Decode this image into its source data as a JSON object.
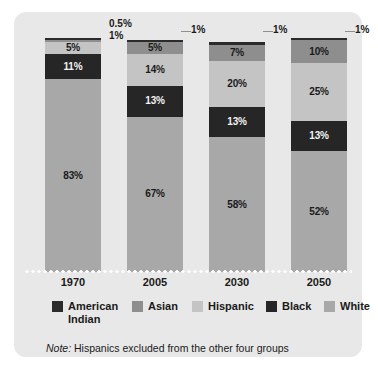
{
  "chart_data": {
    "type": "bar",
    "subtype": "stacked-100-percent",
    "title": "",
    "xlabel": "",
    "ylabel": "",
    "ylim": [
      0,
      100
    ],
    "grid": false,
    "legend_position": "bottom",
    "categories": [
      "1970",
      "2005",
      "2030",
      "2050"
    ],
    "series": [
      {
        "name": "American Indian",
        "color": "#2b2b2b",
        "values": [
          0.5,
          1,
          1,
          1
        ]
      },
      {
        "name": "Asian",
        "color": "#8e8e8e",
        "values": [
          1,
          5,
          7,
          10
        ]
      },
      {
        "name": "Hispanic",
        "color": "#c4c4c4",
        "values": [
          5,
          14,
          20,
          25
        ]
      },
      {
        "name": "Black",
        "color": "#262626",
        "values": [
          11,
          13,
          13,
          13
        ]
      },
      {
        "name": "White",
        "color": "#a8a8a8",
        "values": [
          83,
          67,
          58,
          52
        ]
      }
    ],
    "note": "Hispanics excluded from the other four groups",
    "note_prefix": "Note:"
  },
  "colors": {
    "card": "#e8e8e8",
    "page": "#ffffff",
    "american_indian": "#2b2b2b",
    "asian": "#8e8e8e",
    "hispanic": "#c4c4c4",
    "black": "#262626",
    "white_group": "#a8a8a8",
    "text": "#1a1a1a",
    "baseline_dots": "#ffffff"
  },
  "bars": [
    {
      "year": "1970",
      "segments": [
        {
          "group": "American Indian",
          "value": 0.5,
          "label": "0.5%",
          "label_inside": false,
          "color_key": "american_indian"
        },
        {
          "group": "Asian",
          "value": 1,
          "label": "1%",
          "label_inside": false,
          "color_key": "asian"
        },
        {
          "group": "Hispanic",
          "value": 5,
          "label": "5%",
          "label_inside": true,
          "color_key": "hispanic",
          "label_tone": "dark-text"
        },
        {
          "group": "Black",
          "value": 11,
          "label": "11%",
          "label_inside": true,
          "color_key": "black",
          "label_tone": "light-text"
        },
        {
          "group": "White",
          "value": 83,
          "label": "83%",
          "label_inside": true,
          "color_key": "white_group",
          "label_tone": "dark-text"
        }
      ],
      "callout": "0.5%\n1%"
    },
    {
      "year": "2005",
      "segments": [
        {
          "group": "American Indian",
          "value": 1,
          "label": "1%",
          "label_inside": false,
          "color_key": "american_indian"
        },
        {
          "group": "Asian",
          "value": 5,
          "label": "5%",
          "label_inside": true,
          "color_key": "asian",
          "label_tone": "dark-text"
        },
        {
          "group": "Hispanic",
          "value": 14,
          "label": "14%",
          "label_inside": true,
          "color_key": "hispanic",
          "label_tone": "dark-text"
        },
        {
          "group": "Black",
          "value": 13,
          "label": "13%",
          "label_inside": true,
          "color_key": "black",
          "label_tone": "light-text"
        },
        {
          "group": "White",
          "value": 67,
          "label": "67%",
          "label_inside": true,
          "color_key": "white_group",
          "label_tone": "dark-text"
        }
      ],
      "callout": "1%"
    },
    {
      "year": "2030",
      "segments": [
        {
          "group": "American Indian",
          "value": 1,
          "label": "1%",
          "label_inside": false,
          "color_key": "american_indian"
        },
        {
          "group": "Asian",
          "value": 7,
          "label": "7%",
          "label_inside": true,
          "color_key": "asian",
          "label_tone": "dark-text"
        },
        {
          "group": "Hispanic",
          "value": 20,
          "label": "20%",
          "label_inside": true,
          "color_key": "hispanic",
          "label_tone": "dark-text"
        },
        {
          "group": "Black",
          "value": 13,
          "label": "13%",
          "label_inside": true,
          "color_key": "black",
          "label_tone": "light-text"
        },
        {
          "group": "White",
          "value": 58,
          "label": "58%",
          "label_inside": true,
          "color_key": "white_group",
          "label_tone": "dark-text"
        }
      ],
      "callout": "1%"
    },
    {
      "year": "2050",
      "segments": [
        {
          "group": "American Indian",
          "value": 1,
          "label": "1%",
          "label_inside": false,
          "color_key": "american_indian"
        },
        {
          "group": "Asian",
          "value": 10,
          "label": "10%",
          "label_inside": true,
          "color_key": "asian",
          "label_tone": "dark-text"
        },
        {
          "group": "Hispanic",
          "value": 25,
          "label": "25%",
          "label_inside": true,
          "color_key": "hispanic",
          "label_tone": "dark-text"
        },
        {
          "group": "Black",
          "value": 13,
          "label": "13%",
          "label_inside": true,
          "color_key": "black",
          "label_tone": "light-text"
        },
        {
          "group": "White",
          "value": 52,
          "label": "52%",
          "label_inside": true,
          "color_key": "white_group",
          "label_tone": "dark-text"
        }
      ],
      "callout": "1%"
    }
  ],
  "legend": {
    "items": [
      {
        "label": "American\nIndian",
        "color_key": "american_indian",
        "x": 38,
        "width": 74
      },
      {
        "label": "Asian",
        "color_key": "asian",
        "x": 118,
        "width": 56
      },
      {
        "label": "Hispanic",
        "color_key": "hispanic",
        "x": 178,
        "width": 72
      },
      {
        "label": "Black",
        "color_key": "black",
        "x": 252,
        "width": 54
      },
      {
        "label": "White",
        "color_key": "white_group",
        "x": 310,
        "width": 54
      }
    ]
  },
  "axis": {
    "ticks": [
      "1970",
      "2005",
      "2030",
      "2050"
    ]
  },
  "note": {
    "prefix": "Note:",
    "text": " Hispanics excluded from the other four groups"
  }
}
